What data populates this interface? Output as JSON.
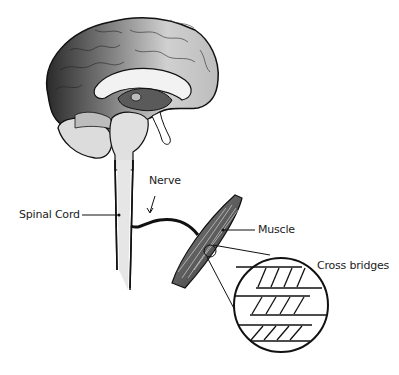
{
  "diagram": {
    "labels": {
      "nerve": "Nerve",
      "spinal_cord": "Spinal Cord",
      "muscle": "Muscle",
      "cross_bridges": "Cross bridges"
    },
    "components": [
      "brain",
      "spinal-cord",
      "nerve",
      "muscle",
      "cross-bridges-magnified-circle"
    ],
    "colors": {
      "line": "#111111",
      "brain_dark": "#3a3a3a",
      "brain_mid": "#8a8a8a",
      "brain_light": "#d8d8d8",
      "spinal_cord": "#e6e6e6",
      "muscle": "#6e6e6e",
      "background": "#ffffff"
    }
  }
}
